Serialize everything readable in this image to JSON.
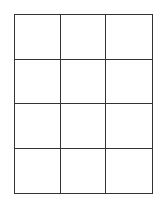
{
  "grid": {
    "columns": 3,
    "rows": 4,
    "line_color": "#333333",
    "background": "#ffffff",
    "cells": [
      [
        "",
        "",
        ""
      ],
      [
        "",
        "",
        ""
      ],
      [
        "",
        "",
        ""
      ],
      [
        "",
        "",
        ""
      ]
    ]
  }
}
